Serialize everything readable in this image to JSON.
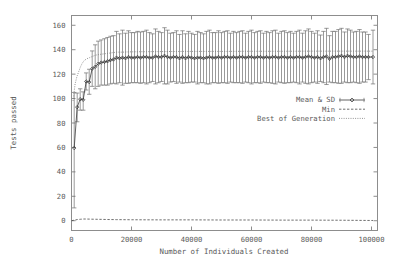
{
  "chart_data": {
    "type": "line",
    "title": "",
    "xlabel": "Number of Individuals Created",
    "ylabel": "Tests passed",
    "xlim": [
      0,
      102000
    ],
    "ylim": [
      -8,
      168
    ],
    "grid": false,
    "legend_position": "right-middle",
    "xticks": [
      0,
      20000,
      40000,
      60000,
      80000,
      100000
    ],
    "xtick_labels": [
      "0",
      "20000",
      "40000",
      "60000",
      "80000",
      "100000"
    ],
    "yticks": [
      0,
      20,
      40,
      60,
      80,
      100,
      120,
      140,
      160
    ],
    "ytick_labels": [
      "0",
      "20",
      "40",
      "60",
      "80",
      "100",
      "120",
      "140",
      "160"
    ],
    "legend": [
      {
        "label": "Mean & SD",
        "style": "points-with-line-errorbars"
      },
      {
        "label": "Min",
        "style": "dashed-line"
      },
      {
        "label": "Best of Generation",
        "style": "dotted-line"
      }
    ],
    "series": [
      {
        "name": "Mean & SD",
        "style": "errorbar",
        "x": [
          900,
          1900,
          2900,
          3900,
          4900,
          5900,
          6900,
          7900,
          8900,
          9900,
          11000,
          12000,
          13000,
          14000,
          15000,
          16000,
          17000,
          18000,
          19000,
          20000,
          21000,
          22000,
          23000,
          24000,
          25000,
          26000,
          27000,
          28000,
          29000,
          30000,
          31000,
          32000,
          33000,
          34000,
          35000,
          36000,
          37000,
          38000,
          39000,
          40000,
          41000,
          42000,
          43000,
          44000,
          45000,
          46000,
          47000,
          48000,
          49000,
          50000,
          51000,
          52000,
          53000,
          54000,
          55000,
          56000,
          57000,
          58000,
          59000,
          60000,
          61000,
          62000,
          63000,
          64000,
          65000,
          66000,
          67000,
          68000,
          69000,
          70000,
          71000,
          72000,
          73000,
          74000,
          75000,
          76000,
          77000,
          78000,
          79000,
          80000,
          81000,
          82000,
          83000,
          84000,
          85000,
          86000,
          87000,
          88000,
          89000,
          90000,
          91000,
          92000,
          93000,
          94000,
          95000,
          96000,
          97000,
          98000,
          99000,
          100500
        ],
        "mean": [
          59.5,
          93.0,
          99.5,
          99.0,
          114.0,
          113.5,
          124.5,
          126.0,
          128.5,
          129.5,
          130.0,
          130.5,
          131.5,
          132.0,
          133.5,
          133.0,
          133.5,
          133.0,
          134.0,
          133.5,
          133.5,
          134.0,
          133.5,
          134.0,
          134.0,
          133.5,
          133.5,
          134.5,
          134.0,
          134.0,
          135.0,
          134.0,
          133.5,
          134.0,
          134.0,
          133.0,
          134.0,
          133.0,
          134.0,
          133.5,
          133.0,
          133.5,
          133.5,
          133.0,
          133.5,
          134.0,
          133.5,
          133.5,
          134.0,
          133.5,
          134.0,
          134.0,
          133.5,
          134.0,
          133.5,
          134.0,
          134.0,
          133.5,
          134.0,
          134.0,
          133.5,
          134.0,
          134.0,
          133.5,
          134.0,
          133.5,
          134.0,
          134.0,
          133.5,
          134.0,
          134.0,
          133.5,
          134.0,
          133.5,
          134.0,
          134.0,
          133.5,
          134.0,
          134.5,
          134.0,
          133.5,
          134.0,
          133.0,
          134.0,
          134.5,
          132.5,
          134.0,
          134.0,
          134.5,
          135.0,
          134.0,
          135.0,
          134.5,
          134.0,
          134.0,
          134.5,
          134.0,
          134.0,
          134.0,
          134.0
        ],
        "sd_upper": [
          105.0,
          104.5,
          108.0,
          105.5,
          121.0,
          124.0,
          139.0,
          144.0,
          147.0,
          148.0,
          149.0,
          150.0,
          151.0,
          151.5,
          155.0,
          153.0,
          156.0,
          153.5,
          155.5,
          154.0,
          154.0,
          155.0,
          154.5,
          155.0,
          156.0,
          154.0,
          153.0,
          157.0,
          155.0,
          154.0,
          158.0,
          156.0,
          153.5,
          154.0,
          155.5,
          152.5,
          155.5,
          153.0,
          155.0,
          153.5,
          152.5,
          155.0,
          154.0,
          153.0,
          155.0,
          156.0,
          154.0,
          154.0,
          155.5,
          154.0,
          155.0,
          155.5,
          153.5,
          155.0,
          154.0,
          155.0,
          155.5,
          153.5,
          155.0,
          156.0,
          154.0,
          155.0,
          155.5,
          153.5,
          155.0,
          154.0,
          155.5,
          156.0,
          153.5,
          155.0,
          155.5,
          154.0,
          155.0,
          153.5,
          155.0,
          156.0,
          153.5,
          155.5,
          157.0,
          155.0,
          153.5,
          155.5,
          152.0,
          155.0,
          157.5,
          151.5,
          155.0,
          155.0,
          156.5,
          157.5,
          154.5,
          157.0,
          156.0,
          154.5,
          155.0,
          156.5,
          154.5,
          154.5,
          152.5,
          156.0
        ],
        "sd_lower": [
          10.5,
          81.0,
          90.5,
          90.5,
          107.0,
          103.5,
          110.0,
          108.0,
          110.0,
          111.0,
          111.0,
          111.0,
          112.0,
          112.5,
          112.0,
          113.0,
          111.0,
          112.5,
          112.5,
          113.0,
          113.0,
          113.0,
          112.5,
          113.0,
          112.0,
          113.0,
          114.0,
          112.0,
          113.0,
          114.0,
          112.0,
          112.0,
          113.5,
          114.0,
          112.5,
          113.5,
          112.5,
          113.0,
          113.0,
          113.5,
          113.5,
          112.0,
          113.0,
          113.0,
          112.0,
          112.0,
          113.0,
          113.0,
          112.5,
          113.0,
          113.0,
          112.5,
          113.5,
          113.0,
          113.0,
          113.0,
          112.5,
          113.5,
          113.0,
          112.0,
          113.0,
          113.0,
          112.5,
          113.5,
          113.0,
          113.0,
          112.5,
          112.0,
          113.5,
          113.0,
          112.5,
          113.0,
          113.0,
          113.5,
          113.0,
          112.0,
          113.5,
          112.5,
          112.0,
          113.0,
          113.5,
          112.5,
          114.0,
          113.0,
          111.5,
          113.5,
          113.0,
          113.0,
          112.5,
          112.5,
          113.5,
          113.0,
          113.0,
          113.5,
          113.0,
          112.5,
          113.5,
          113.5,
          115.5,
          112.0
        ]
      },
      {
        "name": "Min",
        "style": "dashed",
        "x": [
          0,
          1000,
          2000,
          3000,
          4000,
          5000,
          6000,
          8000,
          10000,
          12000,
          15000,
          20000,
          30000,
          40000,
          50000,
          60000,
          70000,
          80000,
          90000,
          100500
        ],
        "y": [
          0.0,
          0.5,
          1.0,
          1.2,
          1.4,
          1.4,
          1.3,
          1.2,
          1.1,
          1.0,
          0.9,
          0.8,
          0.7,
          0.7,
          0.6,
          0.6,
          0.5,
          0.5,
          0.4,
          0.2
        ]
      },
      {
        "name": "Best of Generation",
        "style": "dotted",
        "x": [
          500,
          1200,
          1800,
          2400,
          3000,
          3600,
          4200,
          5000,
          6000,
          7000,
          8000,
          9000,
          10500,
          12000,
          13500,
          15000,
          17000,
          19000,
          21000,
          25000,
          30000,
          40000,
          50000,
          60000,
          70000,
          80000,
          90000,
          100500
        ],
        "y": [
          98.0,
          112.0,
          118.0,
          122.0,
          126.0,
          129.0,
          131.0,
          132.5,
          133.5,
          134.5,
          135.5,
          136.0,
          136.5,
          137.0,
          137.5,
          138.0,
          138.0,
          138.2,
          138.3,
          138.4,
          138.5,
          138.6,
          138.6,
          138.7,
          138.7,
          138.8,
          138.8,
          138.8
        ]
      }
    ]
  },
  "axes": {
    "ylabel": "Tests passed",
    "xlabel": "Number of Individuals Created"
  }
}
